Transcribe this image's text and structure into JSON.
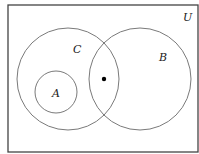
{
  "diagram": {
    "type": "venn",
    "universe": {
      "label": "U",
      "x": 8,
      "y": 5,
      "width": 190,
      "height": 147,
      "label_x": 187,
      "label_y": 21
    },
    "sets": [
      {
        "id": "C",
        "label": "C",
        "cx": 68,
        "cy": 79,
        "r": 51,
        "label_x": 77,
        "label_y": 53
      },
      {
        "id": "B",
        "label": "B",
        "cx": 140,
        "cy": 79,
        "r": 51,
        "label_x": 163,
        "label_y": 61
      },
      {
        "id": "A",
        "label": "A",
        "cx": 56,
        "cy": 92,
        "r": 21,
        "label_x": 56,
        "label_y": 97
      }
    ],
    "point": {
      "x": 104,
      "y": 79,
      "r": 2.2,
      "region": "C ∩ B"
    },
    "colors": {
      "stroke": "#7a7a7a",
      "frame": "#444444",
      "point": "#000000",
      "text": "#222222"
    }
  }
}
